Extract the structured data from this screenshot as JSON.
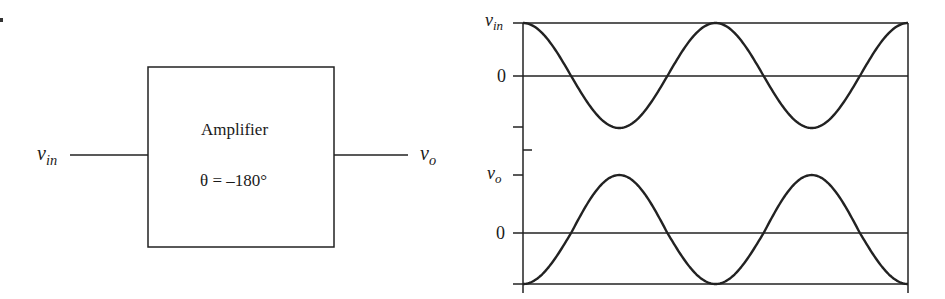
{
  "figure": {
    "block": {
      "title": "Amplifier",
      "phase_label": "θ = –180°"
    },
    "input": {
      "symbol": "v",
      "subscript": "in"
    },
    "output": {
      "symbol": "v",
      "subscript": "o"
    },
    "graph": {
      "top": {
        "label_symbol": "v",
        "label_subscript": "in",
        "zero_label": "0"
      },
      "bottom": {
        "label_symbol": "v",
        "label_subscript": "o",
        "zero_label": "0"
      }
    }
  },
  "chart_data": {
    "type": "line",
    "title": "",
    "xlabel": "",
    "ylabel": "",
    "grid": false,
    "x": [
      0,
      90,
      180,
      270,
      360,
      450,
      540,
      630,
      720
    ],
    "x_unit": "degrees (phase, two full cycles, unlabeled)",
    "series": [
      {
        "name": "v_in",
        "values": [
          1,
          0,
          -1,
          0,
          1,
          0,
          -1,
          0,
          1
        ]
      },
      {
        "name": "v_o",
        "values": [
          -1,
          0,
          1,
          0,
          -1,
          0,
          1,
          0,
          -1
        ]
      }
    ],
    "ytick_labels": [
      "v_in",
      "0",
      "v_o",
      "0"
    ],
    "ylim": [
      -1,
      1
    ],
    "annotations": [
      "Amplifier",
      "θ = –180°"
    ]
  }
}
